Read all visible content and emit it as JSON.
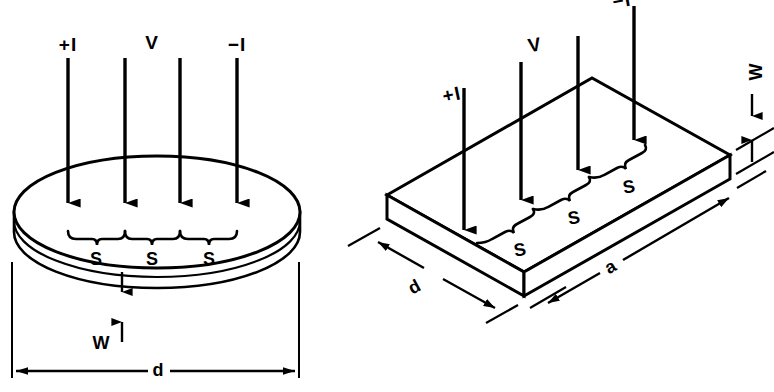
{
  "figure": {
    "title": "",
    "background_color": "#ffffff",
    "ink_color": "#000000",
    "panels": [
      {
        "name": "circular-wafer",
        "shape": "disc",
        "probe_labels": [
          "+I",
          "V",
          "−I"
        ],
        "probe_count": 4,
        "spacing_labels": [
          "S",
          "S",
          "S"
        ],
        "dimension_labels": [
          {
            "symbol": "W",
            "meaning": "thickness"
          },
          {
            "symbol": "d",
            "meaning": "diameter"
          }
        ]
      },
      {
        "name": "rectangular-slab",
        "shape": "rectangular-slab",
        "probe_labels": [
          "+I",
          "V",
          "−I"
        ],
        "probe_count": 4,
        "spacing_labels": [
          "S",
          "S",
          "S"
        ],
        "dimension_labels": [
          {
            "symbol": "W",
            "meaning": "thickness"
          },
          {
            "symbol": "d",
            "meaning": "width"
          },
          {
            "symbol": "a",
            "meaning": "length"
          }
        ]
      }
    ]
  },
  "labels": {
    "left": {
      "probe_plus_i": "+I",
      "probe_v": "V",
      "probe_minus_i": "−I",
      "s1": "S",
      "s2": "S",
      "s3": "S",
      "w": "W",
      "d": "d"
    },
    "right": {
      "probe_plus_i": "+I",
      "probe_v": "V",
      "probe_minus_i": "−I",
      "s1": "S",
      "s2": "S",
      "s3": "S",
      "w": "W",
      "d": "d",
      "a": "a"
    }
  }
}
